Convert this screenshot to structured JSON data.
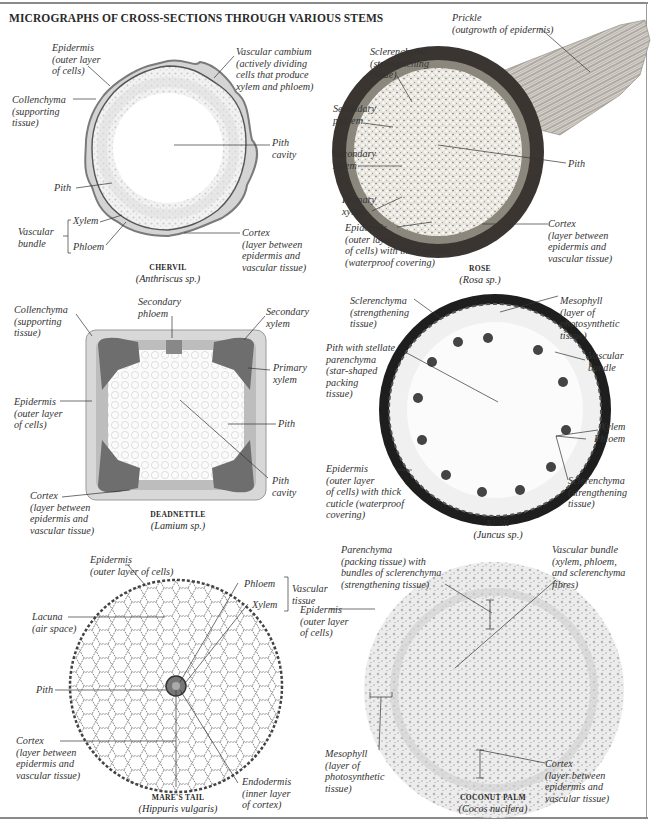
{
  "title": "MICROGRAPHS OF CROSS-SECTIONS THROUGH VARIOUS STEMS",
  "panels": {
    "chervil": {
      "name": "CHERVIL",
      "scientific": "(Anthriscus sp.)",
      "labels": {
        "epidermis": "Epidermis\n(outer layer\nof cells)",
        "vascular_cambium": "Vascular cambium\n(actively dividing\ncells that produce\nxylem and phloem)",
        "collenchyma": "Collenchyma\n(supporting\ntissue)",
        "pith_cavity": "Pith\ncavity",
        "pith": "Pith",
        "xylem": "Xylem",
        "phloem": "Phloem",
        "vascular_bundle": "Vascular\nbundle",
        "cortex": "Cortex\n(layer between\nepidermis and\nvascular tissue)"
      }
    },
    "rose": {
      "name": "ROSE",
      "scientific": "(Rosa sp.)",
      "labels": {
        "prickle": "Prickle\n(outgrowth of epidermis)",
        "sclerenchyma": "Sclerenchyma\n(strengthening\ntissue)",
        "secondary_phloem": "Secondary\nphloem",
        "secondary_xylem": "Secondary\nxylem",
        "pith": "Pith",
        "primary_xylem": "Primary\nxylem",
        "epidermis": "Epidermis\n(outer layer\nof cells) with thick cuticle\n(waterproof covering)",
        "cortex": "Cortex\n(layer between\nepidermis and\nvascular tissue)"
      }
    },
    "deadnettle": {
      "name": "DEADNETTLE",
      "scientific": "(Lamium sp.)",
      "labels": {
        "collenchyma": "Collenchyma\n(supporting\ntissue)",
        "secondary_phloem": "Secondary\nphloem",
        "secondary_xylem": "Secondary\nxylem",
        "primary_xylem": "Primary\nxylem",
        "epidermis": "Epidermis\n(outer layer\nof cells)",
        "pith": "Pith",
        "pith_cavity": "Pith\ncavity",
        "cortex": "Cortex\n(layer between\nepidermis and\nvascular tissue)"
      }
    },
    "rush": {
      "name": "RUSH",
      "scientific": "(Juncus sp.)",
      "labels": {
        "sclerenchyma_top": "Sclerenchyma\n(strengthening\ntissue)",
        "mesophyll": "Mesophyll\n(layer of\nphotosynthetic\ntissue)",
        "pith_stellate": "Pith with stellate\nparenchyma\n(star-shaped\npacking\ntissue)",
        "vascular_bundle": "Vascular\nbundle",
        "xylem": "Xylem",
        "phloem": "Phloem",
        "epidermis": "Epidermis\n(outer layer\nof cells) with thick\ncuticle (waterproof\ncovering)",
        "sclerenchyma_bottom": "Sclerenchyma\n(strengthening\ntissue)"
      }
    },
    "mares_tail": {
      "name": "MARE'S TAIL",
      "scientific": "(Hippuris vulgaris)",
      "labels": {
        "epidermis": "Epidermis\n(outer layer of cells)",
        "phloem": "Phloem",
        "xylem": "Xylem",
        "vascular_tissue": "Vascular\ntissue",
        "lacuna": "Lacuna\n(air space)",
        "pith": "Pith",
        "cortex": "Cortex\n(layer between\nepidermis and\nvascular tissue)",
        "endodermis": "Endodermis\n(inner layer\nof cortex)"
      }
    },
    "coconut_palm": {
      "name": "COCONUT PALM",
      "scientific": "(Cocos nucifera)",
      "labels": {
        "parenchyma": "Parenchyma\n(packing tissue) with\nbundles of sclerenchyma\n(strengthening tissue)",
        "vascular_bundle": "Vascular bundle\n(xylem, phloem,\nand sclerenchyma\nfibres)",
        "epidermis": "Epidermis\n(outer layer\nof cells)",
        "mesophyll": "Mesophyll\n(layer of\nphotosynthetic\ntissue)",
        "cortex": "Cortex\n(layer between\nepidermis and\nvascular tissue)"
      }
    }
  },
  "colors": {
    "ink": "#2a2a2a",
    "frame": "#8a8a8a",
    "rose_dark": "#3a3530",
    "rush_dark": "#1e1e1e"
  }
}
